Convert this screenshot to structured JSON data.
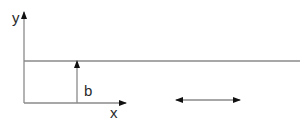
{
  "diagram": {
    "axes": {
      "y_label": "y",
      "x_label": "x"
    },
    "height_label": "b",
    "colors": {
      "line": "#8a8a8a",
      "arrow": "#111111",
      "text": "#2a2a2a",
      "background": "#ffffff"
    }
  }
}
